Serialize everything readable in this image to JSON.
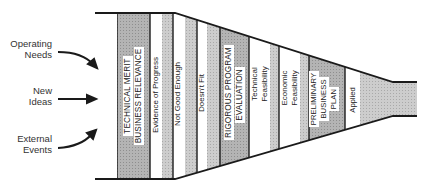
{
  "diagram": {
    "type": "funnel",
    "inputs": [
      {
        "label_line1": "Operating",
        "label_line2": "Needs"
      },
      {
        "label_line1": "New",
        "label_line2": "Ideas"
      },
      {
        "label_line1": "External",
        "label_line2": "Events"
      }
    ],
    "stages": [
      {
        "id": "tech-merit",
        "line1": "TECHNICAL MERIT",
        "line2": "BUSINESS RELEVANCE",
        "style": "gate"
      },
      {
        "id": "evidence",
        "line1": "Evidence of Progress",
        "style": "filter"
      },
      {
        "id": "not-good",
        "line1": "Not Good Enough",
        "style": "filter"
      },
      {
        "id": "doesnt-fit",
        "line1": "Doesn't Fit",
        "style": "filter"
      },
      {
        "id": "rigorous",
        "line1": "RIGOROUS PROGRAM",
        "line2": "EVALUATION",
        "style": "gate"
      },
      {
        "id": "tech-feas",
        "line1": "Technical",
        "line2": "Feasibility",
        "style": "filter"
      },
      {
        "id": "econ-feas",
        "line1": "Economic",
        "line2": "Feasibility",
        "style": "filter"
      },
      {
        "id": "prelim",
        "line1": "PRELIMINARY",
        "line2": "BUSINESS",
        "line3": "PLAN",
        "style": "gate"
      },
      {
        "id": "applied",
        "line1": "Applied",
        "style": "filter"
      }
    ],
    "colors": {
      "outline": "#1a1a1a",
      "gate_fill": "#a8a8a8",
      "stripe_fill": "#c8c8c8",
      "neck_fill": "#d9d9d9",
      "background": "#ffffff"
    }
  }
}
